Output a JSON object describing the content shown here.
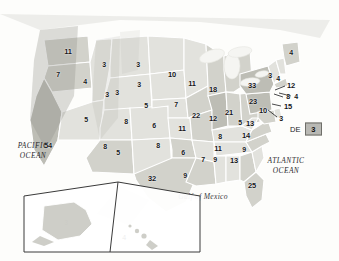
{
  "map": {
    "title": "United States Electoral Vote Map",
    "ocean_labels": {
      "pacific": "PACIFIC\nOCEAN",
      "atlantic": "ATLANTIC\nOCEAN"
    },
    "gulf_label": "Gulf of Mexico",
    "dc_callout": {
      "label": "DC",
      "value": "3"
    },
    "colors": {
      "background": "#fdfdfb",
      "land_light": "#e2e2dd",
      "land_mid": "#d2d2cb",
      "land_dark": "#bdbdb5",
      "border": "#ffffff",
      "outline": "#8e8e88",
      "text": "#17171a",
      "box_fill": "#b9b9b4"
    }
  },
  "chart_data": {
    "type": "map",
    "value_label": "Electoral votes",
    "states": [
      {
        "code": "WA",
        "name": "Washington",
        "value": "11",
        "x": 68,
        "y": 51,
        "shade": "mid"
      },
      {
        "code": "OR",
        "name": "Oregon",
        "value": "7",
        "x": 58,
        "y": 74,
        "shade": "mid"
      },
      {
        "code": "CA",
        "name": "California",
        "value": "54",
        "x": 48,
        "y": 145,
        "shade": "dark"
      },
      {
        "code": "ID",
        "name": "Idaho",
        "value": "4",
        "x": 85,
        "y": 81,
        "shade": "light"
      },
      {
        "code": "NV",
        "name": "Nevada",
        "value": "5",
        "x": 86,
        "y": 119,
        "shade": "light"
      },
      {
        "code": "UT",
        "name": "Utah",
        "value": "3",
        "x": 117,
        "y": 92,
        "shade": "light"
      },
      {
        "code": "AZ",
        "name": "Arizona",
        "value": "8",
        "x": 105,
        "y": 146,
        "shade": "mid"
      },
      {
        "code": "MT",
        "name": "Montana",
        "value": "3",
        "x": 104,
        "y": 64,
        "shade": "light"
      },
      {
        "code": "WY",
        "name": "Wyoming",
        "value": "3",
        "x": 107,
        "y": 94,
        "shade": "light"
      },
      {
        "code": "CO",
        "name": "Colorado",
        "value": "8",
        "x": 126,
        "y": 121,
        "shade": "light"
      },
      {
        "code": "NM",
        "name": "New Mexico",
        "value": "5",
        "x": 118,
        "y": 152,
        "shade": "light"
      },
      {
        "code": "ND",
        "name": "North Dakota",
        "value": "3",
        "x": 138,
        "y": 64,
        "shade": "light"
      },
      {
        "code": "SD",
        "name": "South Dakota",
        "value": "3",
        "x": 139,
        "y": 84,
        "shade": "light"
      },
      {
        "code": "NE",
        "name": "Nebraska",
        "value": "5",
        "x": 146,
        "y": 105,
        "shade": "light"
      },
      {
        "code": "KS",
        "name": "Kansas",
        "value": "6",
        "x": 154,
        "y": 125,
        "shade": "light"
      },
      {
        "code": "OK",
        "name": "Oklahoma",
        "value": "8",
        "x": 158,
        "y": 145,
        "shade": "mid"
      },
      {
        "code": "TX",
        "name": "Texas",
        "value": "32",
        "x": 152,
        "y": 178,
        "shade": "mid"
      },
      {
        "code": "MN",
        "name": "Minnesota",
        "value": "10",
        "x": 172,
        "y": 74,
        "shade": "light"
      },
      {
        "code": "IA",
        "name": "Iowa",
        "value": "7",
        "x": 176,
        "y": 104,
        "shade": "mid"
      },
      {
        "code": "MO",
        "name": "Missouri",
        "value": "11",
        "x": 182,
        "y": 128,
        "shade": "mid"
      },
      {
        "code": "AR",
        "name": "Arkansas",
        "value": "6",
        "x": 183,
        "y": 152,
        "shade": "light"
      },
      {
        "code": "LA",
        "name": "Louisiana",
        "value": "9",
        "x": 185,
        "y": 175,
        "shade": "mid"
      },
      {
        "code": "WI",
        "name": "Wisconsin",
        "value": "11",
        "x": 192,
        "y": 83,
        "shade": "mid"
      },
      {
        "code": "IL",
        "name": "Illinois",
        "value": "22",
        "x": 196,
        "y": 115,
        "shade": "dark"
      },
      {
        "code": "MS",
        "name": "Mississippi",
        "value": "7",
        "x": 203,
        "y": 159,
        "shade": "light"
      },
      {
        "code": "MI",
        "name": "Michigan",
        "value": "18",
        "x": 213,
        "y": 89,
        "shade": "mid"
      },
      {
        "code": "IN",
        "name": "Indiana",
        "value": "12",
        "x": 213,
        "y": 118,
        "shade": "mid"
      },
      {
        "code": "AL",
        "name": "Alabama",
        "value": "9",
        "x": 215,
        "y": 159,
        "shade": "light"
      },
      {
        "code": "KY",
        "name": "Kentucky",
        "value": "8",
        "x": 220,
        "y": 136,
        "shade": "light"
      },
      {
        "code": "TN",
        "name": "Tennessee",
        "value": "11",
        "x": 218,
        "y": 148,
        "shade": "light"
      },
      {
        "code": "OH",
        "name": "Ohio",
        "value": "21",
        "x": 229,
        "y": 112,
        "shade": "mid"
      },
      {
        "code": "GA",
        "name": "Georgia",
        "value": "13",
        "x": 234,
        "y": 160,
        "shade": "mid"
      },
      {
        "code": "WV",
        "name": "West Virginia",
        "value": "5",
        "x": 240,
        "y": 122,
        "shade": "light"
      },
      {
        "code": "SC",
        "name": "South Carolina",
        "value": "9",
        "x": 244,
        "y": 149,
        "shade": "light"
      },
      {
        "code": "NC",
        "name": "North Carolina",
        "value": "14",
        "x": 246,
        "y": 135,
        "shade": "mid"
      },
      {
        "code": "VA",
        "name": "Virginia",
        "value": "13",
        "x": 250,
        "y": 123,
        "shade": "mid"
      },
      {
        "code": "PA",
        "name": "Pennsylvania",
        "value": "23",
        "x": 253,
        "y": 101,
        "shade": "dark"
      },
      {
        "code": "NY",
        "name": "New York",
        "value": "33",
        "x": 252,
        "y": 85,
        "shade": "dark"
      },
      {
        "code": "FL",
        "name": "Florida",
        "value": "25",
        "x": 252,
        "y": 185,
        "shade": "mid"
      },
      {
        "code": "ME",
        "name": "Maine",
        "value": "4",
        "x": 291,
        "y": 52,
        "shade": "mid"
      },
      {
        "code": "VT",
        "name": "Vermont",
        "value": "3",
        "x": 270,
        "y": 75,
        "shade": "light"
      },
      {
        "code": "NH",
        "name": "New Hampshire",
        "value": "4",
        "x": 278,
        "y": 78,
        "shade": "light"
      },
      {
        "code": "MA",
        "name": "Massachusetts",
        "value": "12",
        "x": 291,
        "y": 85,
        "shade": "mid"
      },
      {
        "code": "RI",
        "name": "Rhode Island",
        "value": "4",
        "x": 296,
        "y": 96,
        "shade": "light"
      },
      {
        "code": "CT",
        "name": "Connecticut",
        "value": "8",
        "x": 288,
        "y": 96,
        "shade": "light"
      },
      {
        "code": "NJ",
        "name": "New Jersey",
        "value": "15",
        "x": 288,
        "y": 106,
        "shade": "mid"
      },
      {
        "code": "MD",
        "name": "Maryland",
        "value": "10",
        "x": 263,
        "y": 110,
        "shade": "mid"
      },
      {
        "code": "DE",
        "name": "Delaware",
        "value": "3",
        "x": 281,
        "y": 118,
        "shade": "light"
      },
      {
        "code": "AK",
        "name": "Alaska",
        "value": "3",
        "x": 66,
        "y": 222,
        "shade": "mid"
      },
      {
        "code": "HI",
        "name": "Hawaii",
        "value": "4",
        "x": 124,
        "y": 237,
        "shade": "light"
      }
    ],
    "leader_lines": [
      {
        "code": "MA",
        "x1": 285,
        "y1": 86,
        "x2": 275,
        "y2": 90
      },
      {
        "code": "RI",
        "x1": 291,
        "y1": 96,
        "x2": 279,
        "y2": 93
      },
      {
        "code": "CT",
        "x1": 283,
        "y1": 97,
        "x2": 274,
        "y2": 94
      },
      {
        "code": "NJ",
        "x1": 281,
        "y1": 106,
        "x2": 272,
        "y2": 104
      },
      {
        "code": "DE",
        "x1": 277,
        "y1": 117,
        "x2": 268,
        "y2": 110
      }
    ]
  }
}
